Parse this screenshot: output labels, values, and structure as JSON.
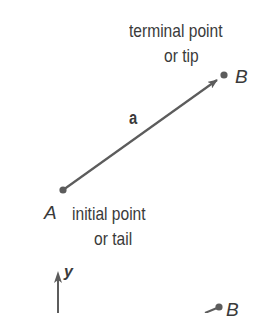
{
  "colors": {
    "vector": "#5c5c5c",
    "point": "#5c5c5c",
    "text": "#3a3a3a",
    "background": "#ffffff"
  },
  "labels": {
    "terminal_line1": "terminal point",
    "terminal_line2": "or tip",
    "point_b": "B",
    "vector_name": "a",
    "point_a": "A",
    "initial_line1": "initial point",
    "initial_line2": "or tail",
    "axis_y": "y",
    "point_b_lower": "B"
  },
  "geometry": {
    "tail": {
      "x": 63,
      "y": 190
    },
    "tip": {
      "x": 224,
      "y": 75
    },
    "y_axis_x": 58,
    "lower_b": {
      "x": 219,
      "y": 307
    }
  }
}
